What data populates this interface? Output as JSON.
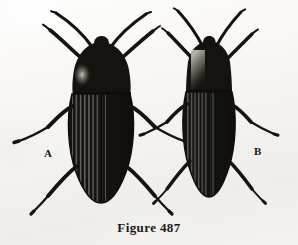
{
  "figure": {
    "caption": "Figure 487",
    "background_color": "#f7f6f4",
    "ink_color": "#141310",
    "medium": "halftone line engraving on aged paper"
  },
  "specimens": [
    {
      "id": "A",
      "label": "A",
      "common_name": "click beetle",
      "family": "Elateridae",
      "view": "dorsal",
      "body_outline": "broad oval elytra, rounded apex, convex pronotum",
      "shading": "dense black with light highlight patch on left of pronotum",
      "elytra_striations": 9,
      "antennae": 2,
      "legs_visible": 6,
      "label_position": {
        "x": 44,
        "y": 147
      }
    },
    {
      "id": "B",
      "label": "B",
      "common_name": "click beetle",
      "family": "Elateridae",
      "view": "dorsal",
      "body_outline": "narrow elongate elytra, parallel-sided pronotum, rounded apex",
      "shading": "dense black with pale gradient down centre-left of pronotum",
      "elytra_striations": 8,
      "antennae": 2,
      "legs_visible": 6,
      "label_position": {
        "x": 254,
        "y": 145
      }
    }
  ]
}
